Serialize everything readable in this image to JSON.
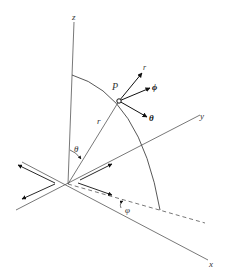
{
  "diagram": {
    "colors": {
      "line": "#444444",
      "arrow": "#111111",
      "background": "#ffffff"
    },
    "axes": {
      "z": {
        "label": "z"
      },
      "y": {
        "label": "y"
      },
      "x": {
        "label": "x"
      }
    },
    "point": {
      "label": "P"
    },
    "radius": {
      "label": "r"
    },
    "angles": {
      "polar": {
        "label": "θ"
      },
      "azimuthal": {
        "label": "φ"
      }
    },
    "unit_vectors": [
      {
        "name": "r",
        "label": "r"
      },
      {
        "name": "phi",
        "label": "ϕ"
      },
      {
        "name": "theta",
        "label": "θ"
      }
    ]
  }
}
